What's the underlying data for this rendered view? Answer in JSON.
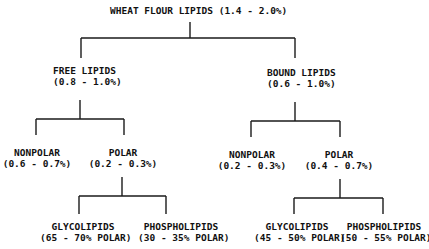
{
  "diagram": {
    "root": {
      "label": "WHEAT FLOUR LIPIDS (1.4 - 2.0%)"
    },
    "free": {
      "title": "FREE LIPIDS",
      "range": "(0.8 - 1.0%)"
    },
    "bound": {
      "title": "BOUND LIPIDS",
      "range": "(0.6 - 1.0%)"
    },
    "free_nonpolar": {
      "title": "NONPOLAR",
      "range": "(0.6 - 0.7%)"
    },
    "free_polar": {
      "title": "POLAR",
      "range": "(0.2 - 0.3%)"
    },
    "bound_nonpolar": {
      "title": "NONPOLAR",
      "range": "(0.2 - 0.3%)"
    },
    "bound_polar": {
      "title": "POLAR",
      "range": "(0.4 - 0.7%)"
    },
    "free_glyco": {
      "title": "GLYCOLIPIDS",
      "range": "(65 - 70% POLAR)"
    },
    "free_phospho": {
      "title": "PHOSPHOLIPIDS",
      "range": "(30 - 35% POLAR)"
    },
    "bound_glyco": {
      "title": "GLYCOLIPIDS",
      "range": "(45 - 50% POLAR)"
    },
    "bound_phospho": {
      "title": "PHOSPHOLIPIDS",
      "range": "(50 - 55% POLAR)"
    }
  },
  "colors": {
    "ink": "#111111",
    "background": "#ffffff"
  }
}
